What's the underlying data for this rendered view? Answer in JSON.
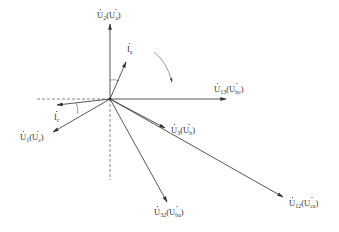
{
  "diagram": {
    "type": "phasor-diagram",
    "origin": {
      "x": 110,
      "y": 99
    },
    "rotation_arrow": {
      "direction": "clockwise"
    },
    "reference_axes": {
      "style": "dashed",
      "horizontal_left": true,
      "vertical_down": true
    },
    "phasors": [
      {
        "id": "U2",
        "label_main": "U",
        "label_main_sub": "2",
        "label_paren": "U",
        "label_paren_sub": "a",
        "end": {
          "x": 110,
          "y": 24
        },
        "label_pos": {
          "x": 97,
          "y": 18
        }
      },
      {
        "id": "Ia",
        "label_main": "I",
        "label_main_sub": "a",
        "end": {
          "x": 126,
          "y": 62
        },
        "label_pos": {
          "x": 127,
          "y": 52
        }
      },
      {
        "id": "U13",
        "label_main": "U",
        "label_main_sub": "13",
        "label_paren": "U",
        "label_paren_sub": "bc",
        "end": {
          "x": 226,
          "y": 99
        },
        "label_pos": {
          "x": 214,
          "y": 92
        }
      },
      {
        "id": "Ic",
        "label_main": "I",
        "label_main_sub": "c",
        "end": {
          "x": 56,
          "y": 105
        },
        "label_pos": {
          "x": 54,
          "y": 120
        }
      },
      {
        "id": "U1",
        "label_main": "U",
        "label_main_sub": "1",
        "label_paren": "U",
        "label_paren_sub": "c",
        "end": {
          "x": 53,
          "y": 132
        },
        "label_pos": {
          "x": 20,
          "y": 140
        }
      },
      {
        "id": "U3",
        "label_main": "U",
        "label_main_sub": "3",
        "label_paren": "U",
        "label_paren_sub": "b",
        "end": {
          "x": 165,
          "y": 128
        },
        "label_pos": {
          "x": 171,
          "y": 133
        }
      },
      {
        "id": "U32",
        "label_main": "U",
        "label_main_sub": "32",
        "label_paren": "U",
        "label_paren_sub": "ba",
        "end": {
          "x": 167,
          "y": 202
        },
        "label_pos": {
          "x": 154,
          "y": 215
        }
      },
      {
        "id": "U12",
        "label_main": "U",
        "label_main_sub": "12",
        "label_paren": "U",
        "label_paren_sub": "ca",
        "end": {
          "x": 283,
          "y": 197
        },
        "label_pos": {
          "x": 289,
          "y": 206
        }
      }
    ]
  },
  "labels": {
    "u2": {
      "main": "U",
      "sub": "2",
      "pmain": "U",
      "psub": "a"
    },
    "ia": {
      "main": "I",
      "sub": "a"
    },
    "u13": {
      "main": "U",
      "sub": "13",
      "pmain": "U",
      "psub": "bc"
    },
    "ic": {
      "main": "I",
      "sub": "c"
    },
    "u1": {
      "main": "U",
      "sub": "1",
      "pmain": "U",
      "psub": "c"
    },
    "u3": {
      "main": "U",
      "sub": "3",
      "pmain": "U",
      "psub": "b"
    },
    "u32": {
      "main": "U",
      "sub": "32",
      "pmain": "U",
      "psub": "ba"
    },
    "u12": {
      "main": "U",
      "sub": "12",
      "pmain": "U",
      "psub": "ca"
    }
  },
  "colors": {
    "line": "#444444",
    "text": "#333333",
    "background": "#ffffff"
  }
}
